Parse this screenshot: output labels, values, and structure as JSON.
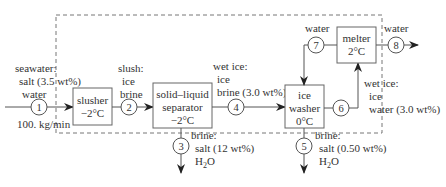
{
  "diagram": {
    "colors": {
      "line": "#555555",
      "box": "#666666",
      "text": "#333333",
      "boundary": "#777777"
    },
    "units": [
      {
        "id": "slusher",
        "line1": "slusher",
        "line2": "−2°C"
      },
      {
        "id": "separator",
        "line1": "solid–liquid",
        "line2": "separator",
        "line3": "−2°C"
      },
      {
        "id": "washer",
        "line1": "ice",
        "line2": "washer",
        "line3": "0°C"
      },
      {
        "id": "melter",
        "line1": "melter",
        "line2": "2°C"
      }
    ],
    "streams": [
      {
        "num": "1",
        "label": [
          "seawater:",
          "salt (3.5 wt%)",
          "water"
        ],
        "flow": "100. kg/min"
      },
      {
        "num": "2",
        "label": [
          "slush:",
          "ice",
          "brine"
        ]
      },
      {
        "num": "3",
        "label": [
          "brine:",
          "salt (12 wt%)",
          "H2O"
        ]
      },
      {
        "num": "4",
        "label": [
          "wet ice:",
          "ice",
          "brine (3.0 wt%)"
        ]
      },
      {
        "num": "5",
        "label": [
          "brine:",
          "salt (0.50 wt%)",
          "H2O"
        ]
      },
      {
        "num": "6",
        "label": [
          "wet ice:",
          "ice",
          "water (3.0 wt%)"
        ]
      },
      {
        "num": "7",
        "label": [
          "water"
        ]
      },
      {
        "num": "8",
        "label": [
          "water"
        ]
      }
    ]
  }
}
